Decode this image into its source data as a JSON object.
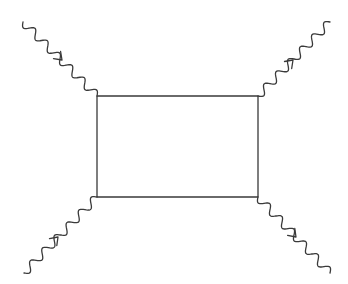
{
  "diagram": {
    "type": "feynman-box-diagram",
    "stroke_color": "#3a3a3a",
    "box": {
      "x": 97,
      "y": 96,
      "width": 161,
      "height": 101
    },
    "external_lines": [
      {
        "id": "top-left",
        "kind": "wavy",
        "from": [
          97,
          96
        ],
        "to": [
          23,
          22
        ],
        "arrow_at": [
          62,
          60
        ],
        "arrow_direction": "toward-box"
      },
      {
        "id": "top-right",
        "kind": "wavy",
        "from": [
          258,
          96
        ],
        "to": [
          330,
          22
        ],
        "arrow_at": [
          293,
          60
        ],
        "arrow_direction": "away-from-box"
      },
      {
        "id": "bottom-left",
        "kind": "wavy",
        "from": [
          97,
          197
        ],
        "to": [
          24,
          273
        ],
        "arrow_at": [
          58,
          237
        ],
        "arrow_direction": "toward-box"
      },
      {
        "id": "bottom-right",
        "kind": "wavy",
        "from": [
          258,
          197
        ],
        "to": [
          330,
          273
        ],
        "arrow_at": [
          296,
          237
        ],
        "arrow_direction": "away-from-box"
      }
    ]
  }
}
